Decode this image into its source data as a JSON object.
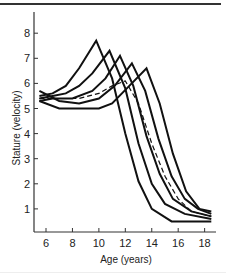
{
  "chart_data": {
    "type": "line",
    "title": "",
    "xlabel": "Age (years)",
    "ylabel": "Stature (velocity)",
    "xlim": [
      5.1,
      18.7
    ],
    "ylim": [
      0,
      8.8
    ],
    "xticks": [
      6,
      8,
      10,
      12,
      14,
      16,
      18
    ],
    "yticks": [
      1,
      2,
      3,
      4,
      5,
      6,
      7,
      8
    ],
    "grid": false,
    "legend": null,
    "series": [
      {
        "name": "individual-1",
        "style": "solid",
        "x": [
          5.5,
          6.5,
          7.5,
          8.5,
          9.8,
          11.0,
          12.0,
          13.0,
          14.0,
          15.5,
          17.5,
          18.5
        ],
        "y": [
          5.5,
          5.6,
          5.9,
          6.6,
          7.7,
          6.2,
          4.0,
          2.1,
          1.0,
          0.5,
          0.5,
          0.5
        ]
      },
      {
        "name": "individual-2",
        "style": "solid",
        "x": [
          5.5,
          6.5,
          7.5,
          8.5,
          9.5,
          10.8,
          12.0,
          13.0,
          14.0,
          15.0,
          16.5,
          18.5
        ],
        "y": [
          5.4,
          5.5,
          5.6,
          5.9,
          6.4,
          7.3,
          5.8,
          3.6,
          2.0,
          1.2,
          0.8,
          0.6
        ]
      },
      {
        "name": "individual-3",
        "style": "solid",
        "x": [
          5.5,
          6.5,
          8.0,
          9.5,
          10.5,
          11.6,
          12.6,
          13.6,
          14.6,
          15.6,
          17.0,
          18.5
        ],
        "y": [
          5.3,
          5.4,
          5.4,
          5.7,
          6.2,
          7.1,
          5.9,
          3.9,
          2.4,
          1.4,
          0.9,
          0.7
        ]
      },
      {
        "name": "individual-4",
        "style": "solid",
        "x": [
          5.5,
          7.0,
          8.5,
          10.0,
          11.2,
          12.5,
          13.5,
          14.5,
          15.5,
          16.5,
          17.5,
          18.5
        ],
        "y": [
          5.7,
          5.3,
          5.2,
          5.4,
          5.9,
          6.8,
          5.7,
          3.8,
          2.3,
          1.4,
          1.0,
          0.8
        ]
      },
      {
        "name": "individual-5",
        "style": "solid",
        "x": [
          5.5,
          7.0,
          8.5,
          10.0,
          11.0,
          12.3,
          13.6,
          14.6,
          15.6,
          16.6,
          17.6,
          18.5
        ],
        "y": [
          5.3,
          5.0,
          5.0,
          5.0,
          5.2,
          5.9,
          6.6,
          5.2,
          3.2,
          1.7,
          1.0,
          0.9
        ]
      },
      {
        "name": "mean",
        "style": "dashed",
        "x": [
          5.5,
          7.0,
          8.5,
          10.0,
          11.0,
          12.0,
          13.0,
          14.0,
          15.0,
          16.0,
          17.0,
          18.5
        ],
        "y": [
          5.4,
          5.4,
          5.4,
          5.6,
          5.9,
          6.1,
          5.2,
          3.6,
          2.3,
          1.4,
          0.9,
          0.7
        ]
      }
    ]
  },
  "axes": {
    "xlabel": "Age (years)",
    "ylabel": "Stature (velocity)"
  },
  "colors": {
    "line": "#111111",
    "axis": "#333333",
    "text": "#222222"
  }
}
